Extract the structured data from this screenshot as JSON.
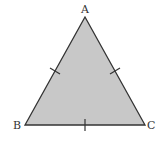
{
  "diagram": {
    "type": "triangle",
    "vertices": [
      {
        "label": "A",
        "x": 85,
        "y": 17
      },
      {
        "label": "B",
        "x": 25,
        "y": 125
      },
      {
        "label": "C",
        "x": 145,
        "y": 125
      }
    ],
    "labels": {
      "a": "A",
      "b": "B",
      "c": "C"
    },
    "tick_marks": [
      {
        "side": "AB",
        "count": 1
      },
      {
        "side": "AC",
        "count": 1
      },
      {
        "side": "BC",
        "count": 1
      }
    ],
    "colors": {
      "fill": "#c8c8c8",
      "stroke": "#333333",
      "background": "#ffffff"
    }
  }
}
